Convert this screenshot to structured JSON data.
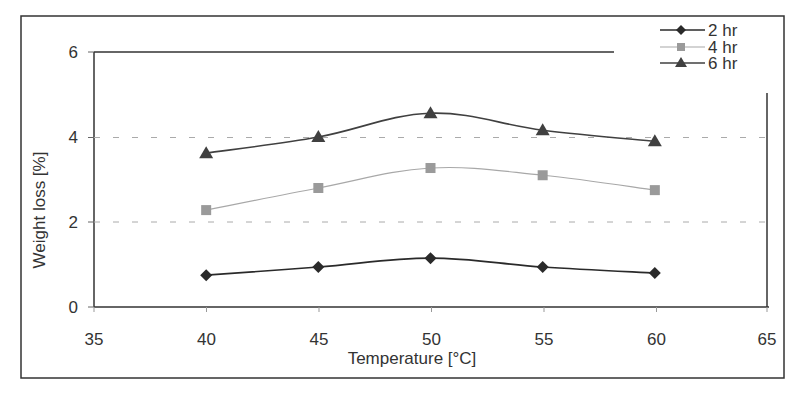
{
  "chart_data": {
    "type": "line",
    "title": "",
    "xlabel": "Temperature [°C]",
    "ylabel": "Weight loss [%]",
    "x": [
      40,
      45,
      50,
      55,
      60
    ],
    "xlim": [
      35,
      65
    ],
    "ylim": [
      0,
      6
    ],
    "xticks": [
      35,
      40,
      45,
      50,
      55,
      60,
      65
    ],
    "yticks": [
      0,
      2,
      4,
      6
    ],
    "grid": "horizontal dashed at y=2 and y=4",
    "legend_position": "top-right",
    "series": [
      {
        "name": "2 hr",
        "marker": "diamond",
        "color": "#2a2a2a",
        "values": [
          0.75,
          0.94,
          1.15,
          0.94,
          0.8
        ]
      },
      {
        "name": "4 hr",
        "marker": "square",
        "color": "#9a9a9a",
        "values": [
          2.28,
          2.8,
          3.27,
          3.1,
          2.75
        ]
      },
      {
        "name": "6 hr",
        "marker": "triangle",
        "color": "#404040",
        "values": [
          3.62,
          4.0,
          4.56,
          4.16,
          3.9
        ]
      }
    ]
  },
  "legend": {
    "items": [
      {
        "label": "2 hr"
      },
      {
        "label": "4 hr"
      },
      {
        "label": "6 hr"
      }
    ]
  },
  "axes": {
    "x_title": "Temperature [°C]",
    "y_title": "Weight loss [%]",
    "x_tick_labels": [
      "35",
      "40",
      "45",
      "50",
      "55",
      "60",
      "65"
    ],
    "y_tick_labels": [
      "0",
      "2",
      "4",
      "6"
    ]
  }
}
